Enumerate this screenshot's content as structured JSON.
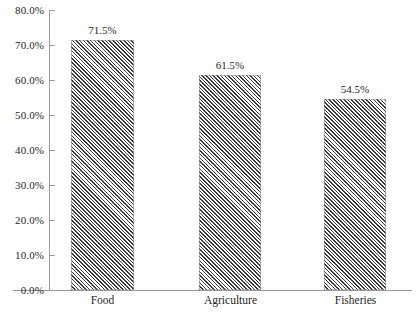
{
  "chart_data": {
    "type": "bar",
    "title": "",
    "xlabel": "",
    "ylabel": "",
    "categories": [
      "Food",
      "Agriculture",
      "Fisheries"
    ],
    "values": [
      71.5,
      61.5,
      54.5
    ],
    "value_labels": [
      "71.5%",
      "61.5%",
      "54.5%"
    ],
    "ylim": [
      0,
      80
    ],
    "ytick_step": 10,
    "ytick_labels": [
      "80.0%",
      "70.0%",
      "60.0%",
      "50.0%",
      "40.0%",
      "30.0%",
      "20.0%",
      "10.0%",
      "0.0%"
    ],
    "ytick_values": [
      80,
      70,
      60,
      50,
      40,
      30,
      20,
      10,
      0
    ],
    "grid": false,
    "legend": null,
    "bar_fill": "diagonal-hatch",
    "colors": {
      "bar_hatch": "#3a3a3a",
      "bar_background": "#ffffff",
      "axis": "#9a9a9a",
      "text": "#1f1f1f"
    }
  }
}
